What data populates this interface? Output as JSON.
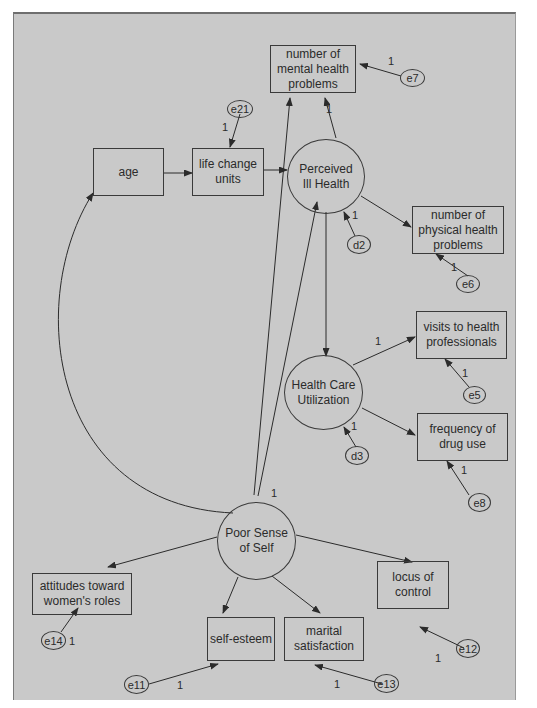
{
  "diagram": {
    "type": "structural-equation-model",
    "background_color": "#c9c9c9",
    "line_color": "#2b2b2b",
    "observed_variables": [
      {
        "id": "mental",
        "label": "number of mental health problems"
      },
      {
        "id": "age",
        "label": "age"
      },
      {
        "id": "lcu",
        "label": "life change units"
      },
      {
        "id": "physical",
        "label": "number of physical health problems"
      },
      {
        "id": "visits",
        "label": "visits to health professionals"
      },
      {
        "id": "drug",
        "label": "frequency of drug use"
      },
      {
        "id": "attitudes",
        "label": "attitudes toward women's roles"
      },
      {
        "id": "locus",
        "label": "locus of control"
      },
      {
        "id": "esteem",
        "label": "self-esteem"
      },
      {
        "id": "marital",
        "label": "marital satisfaction"
      }
    ],
    "latent_variables": [
      {
        "id": "pih",
        "label": "Perceived Ill Health"
      },
      {
        "id": "hcu",
        "label": "Health Care Utilization"
      },
      {
        "id": "pss",
        "label": "Poor Sense of Self"
      }
    ],
    "error_terms": [
      {
        "id": "e7",
        "label": "e7"
      },
      {
        "id": "e21",
        "label": "e21"
      },
      {
        "id": "d2",
        "label": "d2"
      },
      {
        "id": "e6",
        "label": "e6"
      },
      {
        "id": "e5",
        "label": "e5"
      },
      {
        "id": "d3",
        "label": "d3"
      },
      {
        "id": "e8",
        "label": "e8"
      },
      {
        "id": "e14",
        "label": "e14"
      },
      {
        "id": "e12",
        "label": "e12"
      },
      {
        "id": "e11",
        "label": "e11"
      },
      {
        "id": "e13",
        "label": "e13"
      }
    ],
    "paths": [
      {
        "from": "age",
        "to": "lcu",
        "weight": ""
      },
      {
        "from": "lcu",
        "to": "pih",
        "weight": ""
      },
      {
        "from": "pih",
        "to": "mental",
        "weight": "1"
      },
      {
        "from": "pih",
        "to": "physical",
        "weight": ""
      },
      {
        "from": "pih",
        "to": "hcu",
        "weight": ""
      },
      {
        "from": "hcu",
        "to": "visits",
        "weight": "1"
      },
      {
        "from": "hcu",
        "to": "drug",
        "weight": ""
      },
      {
        "from": "pss",
        "to": "mental",
        "weight": ""
      },
      {
        "from": "pss",
        "to": "pih",
        "weight": ""
      },
      {
        "from": "pss",
        "to": "attitudes",
        "weight": "1"
      },
      {
        "from": "pss",
        "to": "locus",
        "weight": ""
      },
      {
        "from": "pss",
        "to": "esteem",
        "weight": ""
      },
      {
        "from": "pss",
        "to": "marital",
        "weight": ""
      },
      {
        "from": "age",
        "to": "pss",
        "weight": "",
        "type": "covariance"
      },
      {
        "from": "e7",
        "to": "mental",
        "weight": "1"
      },
      {
        "from": "e21",
        "to": "lcu",
        "weight": "1"
      },
      {
        "from": "d2",
        "to": "pih",
        "weight": "1"
      },
      {
        "from": "e6",
        "to": "physical",
        "weight": "1"
      },
      {
        "from": "e5",
        "to": "visits",
        "weight": "1"
      },
      {
        "from": "d3",
        "to": "hcu",
        "weight": "1"
      },
      {
        "from": "e8",
        "to": "drug",
        "weight": "1"
      },
      {
        "from": "e14",
        "to": "attitudes",
        "weight": "1"
      },
      {
        "from": "e12",
        "to": "locus",
        "weight": "1"
      },
      {
        "from": "e11",
        "to": "esteem",
        "weight": "1"
      },
      {
        "from": "e13",
        "to": "marital",
        "weight": "1"
      }
    ]
  },
  "nodes": {
    "mental": {
      "l1": "number of",
      "l2": "mental health",
      "l3": "problems"
    },
    "age": "age",
    "lcu": {
      "l1": "life change",
      "l2": "units"
    },
    "physical": {
      "l1": "number of",
      "l2": "physical health",
      "l3": "problems"
    },
    "visits": {
      "l1": "visits to health",
      "l2": "professionals"
    },
    "drug": {
      "l1": "frequency of",
      "l2": "drug use"
    },
    "attitudes": {
      "l1": "attitudes toward",
      "l2": "women's roles"
    },
    "locus": {
      "l1": "locus of",
      "l2": "control"
    },
    "esteem": "self-esteem",
    "marital": {
      "l1": "marital",
      "l2": "satisfaction"
    },
    "pih": {
      "l1": "Perceived",
      "l2": "Ill Health"
    },
    "hcu": {
      "l1": "Health Care",
      "l2": "Utilization"
    },
    "pss": {
      "l1": "Poor Sense",
      "l2": "of Self"
    },
    "e7": "e7",
    "e21": "e21",
    "d2": "d2",
    "e6": "e6",
    "e5": "e5",
    "d3": "d3",
    "e8": "e8",
    "e14": "e14",
    "e12": "e12",
    "e11": "e11",
    "e13": "e13"
  },
  "weights": {
    "w_e7": "1",
    "w_pih_mental": "1",
    "w_e21": "1",
    "w_d2": "1",
    "w_e6": "1",
    "w_hcu_visits": "1",
    "w_e5": "1",
    "w_d3": "1",
    "w_e8": "1",
    "w_pss": "1",
    "w_e14": "1",
    "w_e12": "1",
    "w_e11": "1",
    "w_e13": "1"
  }
}
